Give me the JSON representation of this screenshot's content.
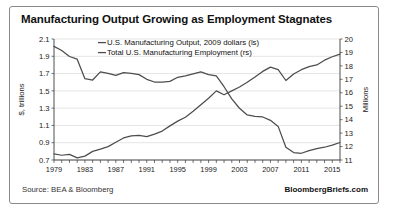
{
  "title": "Manufacturing Output Growing as Employment Stagnates",
  "footer": {
    "source": "Source: BEA & Bloomberg",
    "brand": "BloombergBriefs.com"
  },
  "chart_data": {
    "type": "line",
    "title": "Manufacturing Output Growing as Employment Stagnates",
    "xlabel": "",
    "ylabel": "$, trillions",
    "y2label": "Millions",
    "ylim": [
      0.7,
      2.1
    ],
    "y2lim": [
      11,
      20
    ],
    "yticks": [
      "0.7",
      "0.9",
      "1.1",
      "1.3",
      "1.5",
      "1.7",
      "1.9",
      "2.1"
    ],
    "y2ticks": [
      "11",
      "12",
      "13",
      "14",
      "15",
      "16",
      "17",
      "18",
      "19",
      "20"
    ],
    "xlim": [
      1979,
      2016
    ],
    "xticks": [
      "1979",
      "1983",
      "1987",
      "1991",
      "1995",
      "1999",
      "2003",
      "2007",
      "2011",
      "2015"
    ],
    "grid": true,
    "legend_position": "top-center",
    "x": [
      1979,
      1980,
      1981,
      1982,
      1983,
      1984,
      1985,
      1986,
      1987,
      1988,
      1989,
      1990,
      1991,
      1992,
      1993,
      1994,
      1995,
      1996,
      1997,
      1998,
      1999,
      2000,
      2001,
      2002,
      2003,
      2004,
      2005,
      2006,
      2007,
      2008,
      2009,
      2010,
      2011,
      2012,
      2013,
      2014,
      2015,
      2016
    ],
    "series": [
      {
        "name": "U.S. Manufacturing Output, 2009 dollars (ls)",
        "axis": "left",
        "unit": "$, trillions",
        "values": [
          0.77,
          0.755,
          0.765,
          0.725,
          0.745,
          0.8,
          0.825,
          0.855,
          0.905,
          0.955,
          0.98,
          0.985,
          0.97,
          1.0,
          1.035,
          1.095,
          1.15,
          1.195,
          1.265,
          1.34,
          1.415,
          1.5,
          1.455,
          1.5,
          1.545,
          1.6,
          1.66,
          1.725,
          1.775,
          1.745,
          1.62,
          1.695,
          1.745,
          1.78,
          1.8,
          1.855,
          1.895,
          1.925
        ]
      },
      {
        "name": "Total U.S. Manufacturing Employment (rs)",
        "axis": "right",
        "unit": "Millions",
        "values": [
          19.45,
          19.15,
          18.7,
          18.5,
          17.05,
          16.95,
          17.55,
          17.45,
          17.3,
          17.5,
          17.45,
          17.35,
          17.0,
          16.8,
          16.8,
          16.85,
          17.15,
          17.25,
          17.4,
          17.55,
          17.35,
          17.25,
          16.45,
          15.55,
          14.85,
          14.35,
          14.25,
          14.2,
          13.95,
          13.5,
          11.95,
          11.55,
          11.5,
          11.7,
          11.85,
          11.95,
          12.1,
          12.3
        ]
      }
    ]
  }
}
